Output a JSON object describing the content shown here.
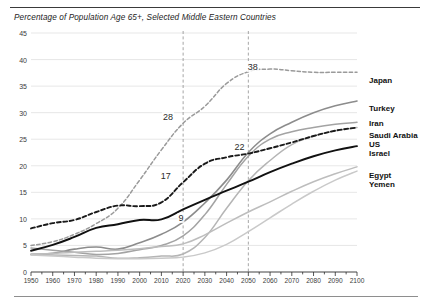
{
  "chart_data": {
    "type": "line",
    "title": "Percentage of Population Age 65+, Selected Middle Eastern Countries",
    "xlabel": "",
    "ylabel": "",
    "xlim": [
      1950,
      2100
    ],
    "ylim": [
      0,
      45
    ],
    "ytick_step": 5,
    "xtick_step": 10,
    "minor_xtick_step": 5,
    "grid": "horizontal",
    "legend_position": "right-of-plot",
    "yticks": [
      "0",
      "5",
      "10",
      "15",
      "20",
      "25",
      "30",
      "35",
      "40",
      "45"
    ],
    "xticks": [
      "1950",
      "1960",
      "1970",
      "1980",
      "1990",
      "2000",
      "2010",
      "2020",
      "2030",
      "2040",
      "2050",
      "2060",
      "2070",
      "2080",
      "2090",
      "2100"
    ],
    "reference_lines": [
      {
        "name": "ref-2020",
        "x": 2020,
        "style": "dashed"
      },
      {
        "name": "ref-2050",
        "x": 2050,
        "style": "dashed"
      }
    ],
    "annotations": [
      {
        "label": "38",
        "x": 2052,
        "y": 38.6,
        "series": "Japan"
      },
      {
        "label": "28",
        "x": 2013,
        "y": 29.2,
        "series": "Japan"
      },
      {
        "label": "22",
        "x": 2046,
        "y": 23.6,
        "series": "US"
      },
      {
        "label": "17",
        "x": 2012,
        "y": 18.0,
        "series": "US"
      },
      {
        "label": "9",
        "x": 2019,
        "y": 10.2,
        "series": "Israel"
      }
    ],
    "x": [
      1950,
      1960,
      1970,
      1980,
      1990,
      2000,
      2010,
      2020,
      2030,
      2040,
      2050,
      2060,
      2070,
      2080,
      2090,
      2100
    ],
    "series": [
      {
        "name": "Japan",
        "color": "#9a9a9a",
        "style": "dashed",
        "width": 1.5,
        "label": "Japan",
        "label_y": 36.0,
        "values": [
          5.0,
          5.7,
          7.1,
          9.1,
          12.0,
          17.3,
          23.0,
          28.0,
          31.2,
          35.5,
          37.7,
          38.2,
          37.9,
          37.6,
          37.6,
          37.6
        ]
      },
      {
        "name": "Turkey",
        "color": "#8c8c8c",
        "style": "solid",
        "width": 1.6,
        "label": "Turkey",
        "label_y": 30.6,
        "values": [
          3.3,
          3.5,
          4.3,
          4.7,
          4.3,
          5.5,
          7.1,
          9.4,
          13.0,
          17.3,
          22.5,
          26.0,
          28.2,
          30.0,
          31.3,
          32.2
        ]
      },
      {
        "name": "Iran",
        "color": "#a3a3a3",
        "style": "solid",
        "width": 1.5,
        "label": "Iran",
        "label_y": 27.8,
        "values": [
          4.5,
          4.1,
          3.7,
          3.3,
          3.5,
          4.2,
          5.0,
          6.8,
          10.8,
          16.5,
          21.8,
          25.0,
          26.4,
          27.2,
          27.8,
          28.2
        ]
      },
      {
        "name": "Saudi Arabia",
        "color": "#b5b5b5",
        "style": "solid",
        "width": 1.5,
        "label": "Saudi Arabia",
        "label_y": 25.6,
        "values": [
          3.3,
          3.2,
          3.1,
          3.0,
          2.6,
          2.7,
          3.0,
          3.4,
          6.5,
          12.0,
          17.2,
          21.0,
          24.0,
          25.6,
          26.6,
          27.2
        ]
      },
      {
        "name": "US",
        "color": "#1a1a1a",
        "style": "dashed",
        "width": 1.9,
        "label": "US",
        "label_y": 23.9,
        "values": [
          8.2,
          9.2,
          9.8,
          11.3,
          12.5,
          12.4,
          13.1,
          16.9,
          20.4,
          21.6,
          22.3,
          23.3,
          24.4,
          25.6,
          26.6,
          27.2
        ]
      },
      {
        "name": "Israel",
        "color": "#111111",
        "style": "solid",
        "width": 1.9,
        "label": "Israel",
        "label_y": 22.2,
        "values": [
          4.0,
          5.1,
          6.6,
          8.3,
          9.0,
          9.8,
          9.9,
          11.8,
          13.6,
          15.3,
          17.0,
          18.8,
          20.4,
          21.8,
          22.9,
          23.7
        ]
      },
      {
        "name": "Egypt",
        "color": "#bdbdbd",
        "style": "solid",
        "width": 1.5,
        "label": "Egypt",
        "label_y": 18.0,
        "values": [
          3.4,
          3.5,
          3.7,
          3.9,
          4.1,
          4.4,
          4.8,
          5.3,
          7.0,
          9.2,
          11.3,
          13.2,
          15.2,
          17.0,
          18.5,
          19.8
        ]
      },
      {
        "name": "Yemen",
        "color": "#c9c9c9",
        "style": "solid",
        "width": 1.5,
        "label": "Yemen",
        "label_y": 16.3,
        "values": [
          3.2,
          3.0,
          2.8,
          2.6,
          2.5,
          2.5,
          2.6,
          2.8,
          3.6,
          5.2,
          7.6,
          10.2,
          12.8,
          15.2,
          17.3,
          19.0
        ]
      }
    ]
  }
}
